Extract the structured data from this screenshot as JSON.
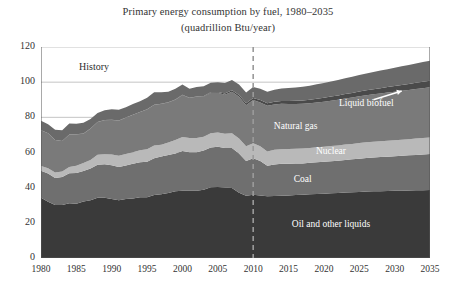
{
  "chart_data": {
    "type": "area",
    "title": "Primary energy consumption by fuel, 1980–2035",
    "subtitle": "(quadrillion Btu/year)",
    "xlabel": "",
    "ylabel": "",
    "stacked": true,
    "grid": true,
    "legend_position": "inline-annotations",
    "xlim": [
      1980,
      2035
    ],
    "ylim": [
      0,
      120
    ],
    "ytick_values": [
      0,
      20,
      40,
      60,
      80,
      100,
      120
    ],
    "ytick_labels": [
      "0",
      "20",
      "40",
      "60",
      "80",
      "100",
      "120"
    ],
    "xtick_values": [
      1980,
      1985,
      1990,
      1995,
      2000,
      2005,
      2010,
      2015,
      2020,
      2025,
      2030,
      2035
    ],
    "xtick_labels": [
      "1980",
      "1985",
      "1990",
      "1995",
      "2000",
      "2005",
      "2010",
      "2015",
      "2020",
      "2025",
      "2030",
      "2035"
    ],
    "x": [
      1980,
      1981,
      1982,
      1983,
      1984,
      1985,
      1986,
      1987,
      1988,
      1989,
      1990,
      1991,
      1992,
      1993,
      1994,
      1995,
      1996,
      1997,
      1998,
      1999,
      2000,
      2001,
      2002,
      2003,
      2004,
      2005,
      2006,
      2007,
      2008,
      2009,
      2010,
      2011,
      2012,
      2013,
      2014,
      2015,
      2016,
      2017,
      2018,
      2019,
      2020,
      2021,
      2022,
      2023,
      2024,
      2025,
      2026,
      2027,
      2028,
      2029,
      2030,
      2031,
      2032,
      2033,
      2034,
      2035
    ],
    "series": [
      {
        "name": "Oil and other liquids",
        "color": "#3a3a3a",
        "values": [
          34.2,
          32.0,
          30.2,
          30.1,
          31.1,
          30.9,
          32.2,
          32.9,
          34.2,
          34.2,
          33.6,
          32.9,
          33.5,
          33.8,
          34.6,
          34.6,
          35.8,
          36.3,
          36.9,
          37.9,
          38.3,
          38.3,
          38.2,
          38.8,
          40.3,
          40.4,
          40.1,
          39.8,
          37.1,
          35.4,
          36.0,
          35.5,
          35.1,
          35.2,
          35.4,
          35.6,
          35.8,
          36.0,
          36.2,
          36.4,
          36.6,
          36.8,
          37.0,
          37.2,
          37.4,
          37.6,
          37.8,
          37.9,
          38.0,
          38.1,
          38.2,
          38.3,
          38.4,
          38.5,
          38.6,
          38.7
        ]
      },
      {
        "name": "Coal",
        "color": "#6f6f6f",
        "values": [
          15.4,
          16.0,
          15.3,
          15.9,
          17.1,
          17.5,
          17.3,
          18.0,
          18.8,
          19.1,
          19.2,
          18.8,
          19.1,
          19.8,
          19.9,
          20.1,
          21.0,
          21.4,
          21.7,
          21.6,
          22.6,
          21.9,
          21.9,
          22.3,
          22.5,
          22.8,
          22.4,
          22.7,
          22.4,
          19.7,
          20.8,
          19.7,
          17.4,
          18.0,
          18.2,
          18.0,
          17.9,
          17.8,
          17.9,
          18.0,
          18.1,
          18.2,
          18.3,
          18.5,
          18.7,
          18.9,
          19.1,
          19.2,
          19.4,
          19.5,
          19.7,
          19.8,
          20.0,
          20.1,
          20.3,
          20.4
        ]
      },
      {
        "name": "Nuclear",
        "color": "#b9b9b9",
        "values": [
          2.7,
          3.0,
          3.1,
          3.2,
          3.6,
          4.1,
          4.5,
          4.9,
          5.7,
          5.7,
          6.1,
          6.4,
          6.5,
          6.5,
          6.8,
          7.1,
          7.2,
          6.7,
          7.1,
          7.6,
          7.9,
          8.0,
          8.1,
          7.9,
          8.2,
          8.2,
          8.2,
          8.5,
          8.4,
          8.4,
          8.4,
          8.3,
          8.1,
          8.3,
          8.3,
          8.4,
          8.4,
          8.5,
          8.5,
          8.6,
          8.6,
          8.7,
          8.7,
          8.8,
          8.8,
          8.9,
          8.9,
          9.0,
          9.0,
          9.1,
          9.1,
          9.2,
          9.2,
          9.3,
          9.3,
          9.4
        ]
      },
      {
        "name": "Natural gas",
        "color": "#7a7a7a",
        "values": [
          20.4,
          19.9,
          18.5,
          17.4,
          18.5,
          17.8,
          16.7,
          17.7,
          18.6,
          19.4,
          19.6,
          20.0,
          20.7,
          21.3,
          21.7,
          22.7,
          23.1,
          23.2,
          22.8,
          22.9,
          23.8,
          22.8,
          23.5,
          22.8,
          22.9,
          22.6,
          22.2,
          23.6,
          23.8,
          23.4,
          24.6,
          25.0,
          26.0,
          25.8,
          25.8,
          25.6,
          25.5,
          25.4,
          25.4,
          25.5,
          25.6,
          25.8,
          26.0,
          26.2,
          26.4,
          26.6,
          26.8,
          27.0,
          27.2,
          27.4,
          27.6,
          27.8,
          28.0,
          28.2,
          28.4,
          28.6
        ]
      },
      {
        "name": "Liquid biofuel",
        "color": "#4a4a4a",
        "values": [
          0.0,
          0.0,
          0.0,
          0.0,
          0.0,
          0.1,
          0.1,
          0.1,
          0.1,
          0.1,
          0.1,
          0.1,
          0.1,
          0.1,
          0.1,
          0.1,
          0.1,
          0.1,
          0.1,
          0.1,
          0.2,
          0.2,
          0.2,
          0.3,
          0.3,
          0.4,
          0.6,
          0.8,
          1.0,
          1.1,
          1.2,
          1.3,
          1.4,
          1.5,
          1.6,
          1.7,
          1.8,
          1.9,
          2.0,
          2.1,
          2.2,
          2.3,
          2.4,
          2.5,
          2.6,
          2.7,
          2.8,
          2.9,
          3.0,
          3.1,
          3.2,
          3.3,
          3.4,
          3.5,
          3.6,
          3.7
        ]
      },
      {
        "name": "Other renewables",
        "color": "#6a6a6a",
        "values": [
          5.3,
          5.2,
          5.9,
          6.0,
          6.2,
          5.9,
          6.1,
          5.5,
          5.1,
          5.5,
          6.0,
          6.1,
          5.8,
          6.1,
          6.1,
          6.5,
          7.0,
          6.6,
          6.0,
          6.1,
          5.9,
          5.0,
          5.4,
          5.6,
          5.5,
          5.5,
          6.0,
          5.8,
          6.0,
          6.1,
          6.2,
          6.5,
          6.6,
          6.9,
          7.1,
          7.4,
          7.6,
          7.8,
          8.0,
          8.2,
          8.4,
          8.6,
          8.8,
          9.0,
          9.2,
          9.4,
          9.6,
          9.8,
          10.0,
          10.2,
          10.4,
          10.6,
          10.8,
          11.0,
          11.2,
          11.4
        ]
      }
    ],
    "annotations": [
      {
        "name": "history",
        "text": "History",
        "x": 1987.5,
        "y": 108
      },
      {
        "name": "other-renewables",
        "text": "Other renewables",
        "x": 2021,
        "y": 110
      },
      {
        "name": "liquid-biofuel",
        "text": "Liquid biofuel",
        "x": 2026,
        "y": 87
      },
      {
        "name": "natural-gas",
        "text": "Natural gas",
        "x": 2016,
        "y": 74
      },
      {
        "name": "nuclear",
        "text": "Nuclear",
        "x": 2021,
        "y": 60
      },
      {
        "name": "coal",
        "text": "Coal",
        "x": 2017,
        "y": 44
      },
      {
        "name": "oil",
        "text": "Oil and other liquids",
        "x": 2021,
        "y": 18
      }
    ],
    "divider": {
      "name": "projection-divider",
      "x": 2010,
      "style": "dashed",
      "color": "#9a9a9a"
    },
    "arrow": {
      "name": "liquid-biofuel-arrow",
      "color": "#ffffff",
      "from_x": 2027,
      "from_y": 90,
      "to_x": 2031,
      "to_y": 95
    }
  }
}
